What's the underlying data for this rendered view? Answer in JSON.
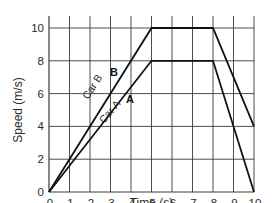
{
  "chart_data": {
    "type": "line",
    "title": "",
    "xlabel": "Time (s)",
    "ylabel": "Speed (m/s)",
    "xlim": [
      0,
      10
    ],
    "ylim": [
      0,
      10
    ],
    "x_ticks": [
      "0",
      "1",
      "2",
      "3",
      "4",
      "5",
      "6",
      "7",
      "8",
      "9",
      "10"
    ],
    "y_ticks": [
      "0",
      "2",
      "4",
      "6",
      "8",
      "10"
    ],
    "grid": true,
    "legend": "none (inline line labels)",
    "series": [
      {
        "name": "Car B",
        "marker_label": "B",
        "x": [
          0,
          5,
          8,
          10
        ],
        "y": [
          0,
          10,
          10,
          4
        ]
      },
      {
        "name": "Car A",
        "marker_label": "A",
        "x": [
          0,
          5,
          8,
          10
        ],
        "y": [
          0,
          8,
          8,
          0
        ]
      }
    ],
    "annotations": [
      "Car B",
      "B",
      "Car A",
      "A"
    ]
  },
  "colors": {
    "background": "#ffffff",
    "grid": "#3a3a3a",
    "line": "#111111",
    "text": "#2a2a2a"
  }
}
